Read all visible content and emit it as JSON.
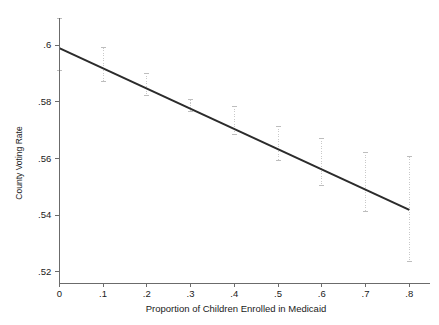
{
  "chart_data": {
    "type": "line",
    "title": "",
    "subtitle": "",
    "xlabel": "Proportion of Children Enrolled in Medicaid",
    "ylabel": "County Voting Rate",
    "xlim": [
      0,
      0.8
    ],
    "ylim": [
      0.515,
      0.611
    ],
    "xticks": [
      0,
      0.1,
      0.2,
      0.3,
      0.4,
      0.5,
      0.6,
      0.7,
      0.8
    ],
    "xticklabels": [
      "0",
      ".1",
      ".2",
      ".3",
      ".4",
      ".5",
      ".6",
      ".7",
      ".8"
    ],
    "yticks": [
      0.52,
      0.54,
      0.56,
      0.58,
      0.6
    ],
    "yticklabels": [
      ".52",
      ".54",
      ".56",
      ".58",
      ".6"
    ],
    "grid": false,
    "legend": null,
    "legend_position": "none",
    "series": [
      {
        "name": "Predicted county voting rate",
        "kind": "line",
        "x": [
          0,
          0.8
        ],
        "values": [
          0.5989,
          0.5418
        ]
      },
      {
        "name": "95% confidence interval",
        "kind": "errorbar",
        "x": [
          0,
          0.1,
          0.2,
          0.3,
          0.4,
          0.5,
          0.6,
          0.7,
          0.8
        ],
        "values": [
          0.5989,
          0.5918,
          0.5846,
          0.5775,
          0.5704,
          0.5632,
          0.5561,
          0.5489,
          0.5418
        ],
        "lower": [
          0.5911,
          0.587,
          0.5823,
          0.5764,
          0.5685,
          0.5594,
          0.5505,
          0.5411,
          0.5235
        ],
        "upper": [
          0.6095,
          0.599,
          0.59,
          0.5806,
          0.5784,
          0.5713,
          0.5671,
          0.5622,
          0.5606
        ]
      }
    ]
  },
  "axes": {
    "y_axis_label": "County Voting Rate",
    "x_axis_label": "Proportion of Children Enrolled in Medicaid"
  },
  "colors": {
    "line": "#2b2b2b",
    "ci": "#c9c9c9",
    "axis": "#6b6b6b",
    "text": "#1a1a1a",
    "background": "#ffffff"
  }
}
